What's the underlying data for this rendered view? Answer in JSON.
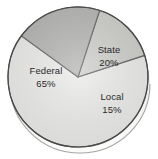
{
  "chart_data": {
    "type": "pie",
    "title": "",
    "subtitle": "",
    "xlabel": "",
    "ylabel": "",
    "legend_position": "none",
    "grid": false,
    "labels_on_slices": true,
    "categories": [
      "Federal",
      "State",
      "Local"
    ],
    "values": [
      65,
      20,
      15
    ],
    "value_unit": "%",
    "slices": [
      {
        "name": "Federal",
        "label": "Federal",
        "value": 65,
        "value_label": "65%",
        "color": "#e9e9e7",
        "start_angle_deg": 72,
        "end_angle_deg": 306
      },
      {
        "name": "State",
        "label": "State",
        "value": 20,
        "value_label": "20%",
        "color": "#a9a9a7",
        "start_angle_deg": 306,
        "end_angle_deg": 378
      },
      {
        "name": "Local",
        "label": "Local",
        "value": 15,
        "value_label": "15%",
        "color": "#c6c6c3",
        "start_angle_deg": 18,
        "end_angle_deg": 72
      }
    ]
  },
  "figure": {
    "name": "pie-chart-government-funding",
    "background_color": "#ffffff",
    "outline_color": "#4a4a4a",
    "shadow_color": "#b9b9b6",
    "center_x": 78,
    "center_y": 77,
    "radius": 70
  },
  "labels": {
    "federal_name": "Federal",
    "federal_value": "65%",
    "state_name": "State",
    "state_value": "20%",
    "local_name": "Local",
    "local_value": "15%"
  }
}
